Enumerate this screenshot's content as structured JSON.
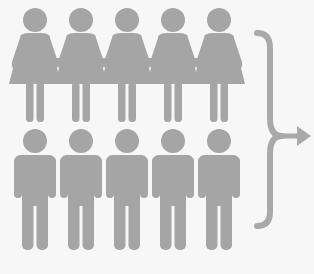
{
  "diagram": {
    "colors": {
      "background": "#f7f7f7",
      "figure": "#a5a5a5",
      "brace": "#a9a9a9"
    },
    "rows": [
      {
        "name": "women",
        "count": 5,
        "centers_x": [
          35,
          81,
          127,
          173,
          219
        ]
      },
      {
        "name": "men",
        "count": 5,
        "centers_x": [
          35,
          81,
          127,
          173,
          219
        ]
      }
    ],
    "brace": {
      "icon": "curly-brace-icon",
      "arrow_icon": "arrow-right-icon",
      "direction": "right"
    }
  }
}
